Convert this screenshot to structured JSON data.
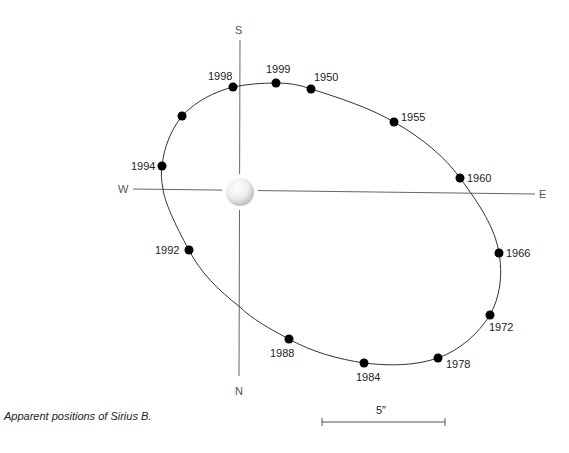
{
  "title": "Apparent positions of Sirius B.",
  "caption": "Apparent positions of Sirius B.",
  "directions": {
    "north": "N",
    "south": "S",
    "east": "E",
    "west": "W"
  },
  "scale_bar": {
    "label": "5″"
  },
  "primary_star": {
    "name": "Sirius A",
    "icon": "star-sphere"
  },
  "colors": {
    "ink": "#111111",
    "axis": "#666666",
    "orbit": "#333333",
    "dot": "#000000"
  },
  "positions": [
    {
      "year": "1950",
      "x": 311,
      "y": 89
    },
    {
      "year": "1955",
      "x": 394,
      "y": 122
    },
    {
      "year": "1960",
      "x": 460,
      "y": 178
    },
    {
      "year": "1966",
      "x": 499,
      "y": 253
    },
    {
      "year": "1972",
      "x": 490,
      "y": 315
    },
    {
      "year": "1978",
      "x": 438,
      "y": 358
    },
    {
      "year": "1984",
      "x": 364,
      "y": 363
    },
    {
      "year": "1988",
      "x": 289,
      "y": 339
    },
    {
      "year": "1992",
      "x": 189,
      "y": 250
    },
    {
      "year": "1994",
      "x": 162,
      "y": 166
    },
    {
      "year": "",
      "x": 182,
      "y": 116
    },
    {
      "year": "1998",
      "x": 233,
      "y": 87
    },
    {
      "year": "1999",
      "x": 276,
      "y": 83
    }
  ]
}
